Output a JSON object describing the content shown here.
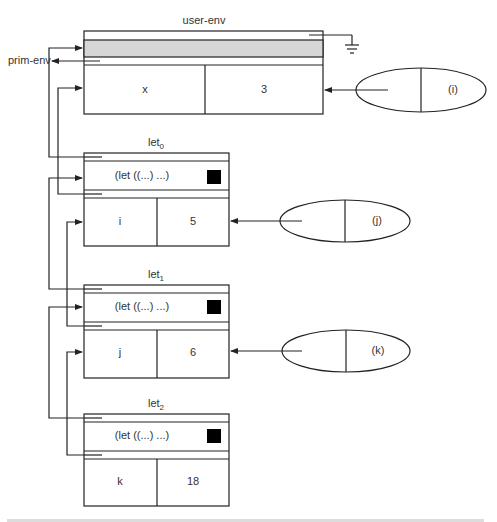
{
  "diagram": {
    "type": "environment-diagram",
    "global_env": {
      "title": "user-env",
      "parent_label": "prim-env",
      "bindings": [
        {
          "name": "x",
          "value": "3"
        }
      ]
    },
    "frames": [
      {
        "id": "let0",
        "title_base": "let",
        "title_sub": "0",
        "body": "(let ((...) ...)",
        "bindings": [
          {
            "name": "i",
            "value": "5"
          }
        ]
      },
      {
        "id": "let1",
        "title_base": "let",
        "title_sub": "1",
        "body": "(let ((...) ...)",
        "bindings": [
          {
            "name": "j",
            "value": "6"
          }
        ]
      },
      {
        "id": "let2",
        "title_base": "let",
        "title_sub": "2",
        "body": "(let ((...) ...)",
        "bindings": [
          {
            "name": "k",
            "value": "18"
          }
        ]
      }
    ],
    "procedures": [
      {
        "id": "proc-i",
        "param": "(i)",
        "points_to": "user-env"
      },
      {
        "id": "proc-j",
        "param": "(j)",
        "points_to": "let0"
      },
      {
        "id": "proc-k",
        "param": "(k)",
        "points_to": "let1"
      }
    ],
    "colors": {
      "line": "#222222",
      "gray_band": "#d6d6d6",
      "marker": "#000000"
    }
  }
}
